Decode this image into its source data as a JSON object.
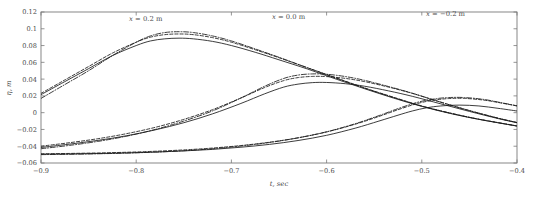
{
  "chart_data": {
    "type": "line",
    "title": "",
    "xlabel": "t, sec",
    "ylabel": "η, m",
    "xlim": [
      -0.9,
      -0.4
    ],
    "ylim": [
      -0.06,
      0.12
    ],
    "grid": false,
    "legend_position": "none",
    "xticks": [
      "-0.9",
      "-0.8",
      "-0.7",
      "-0.6",
      "-0.5",
      "-0.4"
    ],
    "xtick_values": [
      -0.9,
      -0.8,
      -0.7,
      -0.6,
      -0.5,
      -0.4
    ],
    "yticks": [
      "0.12",
      "0.1",
      "0.08",
      "0.06",
      "0.04",
      "0.02",
      "0",
      "-0.02",
      "-0.04",
      "-0.06"
    ],
    "ytick_values": [
      0.12,
      0.1,
      0.08,
      0.06,
      0.04,
      0.02,
      0,
      -0.02,
      -0.04,
      -0.06
    ],
    "annotations": [
      {
        "text": "x = 0.2 m",
        "x": -0.79,
        "y": 0.109
      },
      {
        "text": "x = 0.0 m",
        "x": -0.64,
        "y": 0.112
      },
      {
        "text": "x = −0.2 m",
        "x": -0.475,
        "y": 0.115
      }
    ],
    "groups": [
      {
        "name": "x = 0.2 m",
        "series": [
          {
            "name": "solid",
            "style": "solid",
            "x": [
              -0.9,
              -0.875,
              -0.85,
              -0.825,
              -0.8,
              -0.785,
              -0.77,
              -0.755,
              -0.74,
              -0.72,
              -0.7,
              -0.675,
              -0.65,
              -0.62,
              -0.59,
              -0.56,
              -0.53,
              -0.5,
              -0.47,
              -0.44,
              -0.4
            ],
            "y": [
              0.0215,
              0.037,
              0.0525,
              0.068,
              0.08,
              0.0855,
              0.088,
              0.0888,
              0.088,
              0.085,
              0.08,
              0.072,
              0.063,
              0.052,
              0.04,
              0.0285,
              0.0175,
              0.0075,
              -0.001,
              -0.008,
              -0.016
            ]
          },
          {
            "name": "dashed",
            "style": "dashed",
            "x": [
              -0.9,
              -0.875,
              -0.85,
              -0.825,
              -0.8,
              -0.785,
              -0.77,
              -0.755,
              -0.74,
              -0.72,
              -0.7,
              -0.675,
              -0.65,
              -0.62,
              -0.59,
              -0.56,
              -0.53,
              -0.5,
              -0.47,
              -0.44,
              -0.4
            ],
            "y": [
              0.023,
              0.039,
              0.055,
              0.071,
              0.084,
              0.09,
              0.093,
              0.0938,
              0.093,
              0.0895,
              0.084,
              0.075,
              0.0655,
              0.0535,
              0.0415,
              0.0295,
              0.0185,
              0.008,
              -0.0005,
              -0.0078,
              -0.0158
            ]
          },
          {
            "name": "dashdot",
            "style": "dashdot",
            "x": [
              -0.9,
              -0.875,
              -0.85,
              -0.825,
              -0.8,
              -0.785,
              -0.77,
              -0.755,
              -0.74,
              -0.72,
              -0.7,
              -0.675,
              -0.65,
              -0.62,
              -0.59,
              -0.56,
              -0.53,
              -0.5,
              -0.47,
              -0.44,
              -0.4
            ],
            "y": [
              0.017,
              0.0335,
              0.05,
              0.068,
              0.084,
              0.0915,
              0.0955,
              0.0965,
              0.0955,
              0.0915,
              0.0855,
              0.076,
              0.066,
              0.0535,
              0.0412,
              0.0292,
              0.0182,
              0.0078,
              -0.0006,
              -0.0078,
              -0.0158
            ]
          }
        ]
      },
      {
        "name": "x = 0.0 m",
        "series": [
          {
            "name": "solid",
            "style": "solid",
            "x": [
              -0.9,
              -0.87,
              -0.84,
              -0.81,
              -0.78,
              -0.75,
              -0.72,
              -0.69,
              -0.665,
              -0.645,
              -0.63,
              -0.615,
              -0.6,
              -0.58,
              -0.56,
              -0.535,
              -0.51,
              -0.48,
              -0.45,
              -0.42,
              -0.4
            ],
            "y": [
              -0.0415,
              -0.0375,
              -0.033,
              -0.0275,
              -0.0205,
              -0.012,
              -0.0015,
              0.011,
              0.0225,
              0.0305,
              0.034,
              0.0358,
              0.036,
              0.0345,
              0.0315,
              0.026,
              0.0195,
              0.0105,
              0.0015,
              -0.007,
              -0.012
            ]
          },
          {
            "name": "dashed",
            "style": "dashed",
            "x": [
              -0.9,
              -0.87,
              -0.84,
              -0.81,
              -0.78,
              -0.75,
              -0.72,
              -0.69,
              -0.665,
              -0.645,
              -0.63,
              -0.615,
              -0.6,
              -0.58,
              -0.56,
              -0.535,
              -0.51,
              -0.48,
              -0.45,
              -0.42,
              -0.4
            ],
            "y": [
              -0.04,
              -0.0358,
              -0.031,
              -0.025,
              -0.0175,
              -0.008,
              0.0035,
              0.0175,
              0.03,
              0.0382,
              0.0418,
              0.0432,
              0.043,
              0.0408,
              0.037,
              0.0305,
              0.023,
              0.0125,
              0.0025,
              -0.0065,
              -0.0118
            ]
          },
          {
            "name": "dashdot",
            "style": "dashdot",
            "x": [
              -0.9,
              -0.87,
              -0.84,
              -0.81,
              -0.78,
              -0.75,
              -0.72,
              -0.69,
              -0.665,
              -0.645,
              -0.63,
              -0.615,
              -0.6,
              -0.58,
              -0.56,
              -0.535,
              -0.51,
              -0.48,
              -0.45,
              -0.42,
              -0.4
            ],
            "y": [
              -0.043,
              -0.039,
              -0.0342,
              -0.028,
              -0.02,
              -0.01,
              0.002,
              0.0175,
              0.0315,
              0.0408,
              0.0448,
              0.0462,
              0.0458,
              0.043,
              0.0385,
              0.0312,
              0.0232,
              0.0125,
              0.0025,
              -0.0065,
              -0.0118
            ]
          }
        ]
      },
      {
        "name": "x = -0.2 m",
        "series": [
          {
            "name": "solid",
            "style": "solid",
            "x": [
              -0.9,
              -0.87,
              -0.84,
              -0.81,
              -0.78,
              -0.75,
              -0.72,
              -0.69,
              -0.66,
              -0.63,
              -0.6,
              -0.57,
              -0.545,
              -0.525,
              -0.51,
              -0.495,
              -0.48,
              -0.46,
              -0.44,
              -0.42,
              -0.4
            ],
            "y": [
              -0.0495,
              -0.0492,
              -0.0487,
              -0.048,
              -0.047,
              -0.0456,
              -0.0438,
              -0.0412,
              -0.0378,
              -0.0332,
              -0.027,
              -0.0185,
              -0.01,
              -0.003,
              0.002,
              0.0058,
              0.008,
              0.009,
              0.008,
              0.0052,
              0.002
            ]
          },
          {
            "name": "dashed",
            "style": "dashed",
            "x": [
              -0.9,
              -0.87,
              -0.84,
              -0.81,
              -0.78,
              -0.75,
              -0.72,
              -0.69,
              -0.66,
              -0.63,
              -0.6,
              -0.57,
              -0.545,
              -0.525,
              -0.505,
              -0.488,
              -0.472,
              -0.455,
              -0.435,
              -0.418,
              -0.4
            ],
            "y": [
              -0.049,
              -0.0486,
              -0.048,
              -0.0472,
              -0.046,
              -0.0444,
              -0.0422,
              -0.0392,
              -0.0352,
              -0.03,
              -0.023,
              -0.0138,
              -0.0045,
              0.0035,
              0.0108,
              0.0148,
              0.0168,
              0.017,
              0.015,
              0.0118,
              0.008
            ]
          },
          {
            "name": "dashdot",
            "style": "dashdot",
            "x": [
              -0.9,
              -0.87,
              -0.84,
              -0.81,
              -0.78,
              -0.75,
              -0.72,
              -0.69,
              -0.66,
              -0.63,
              -0.6,
              -0.57,
              -0.545,
              -0.525,
              -0.505,
              -0.488,
              -0.472,
              -0.455,
              -0.435,
              -0.418,
              -0.4
            ],
            "y": [
              -0.05,
              -0.0496,
              -0.049,
              -0.0482,
              -0.047,
              -0.0454,
              -0.043,
              -0.0398,
              -0.0356,
              -0.03,
              -0.0228,
              -0.0132,
              -0.0035,
              0.0048,
              0.0122,
              0.0162,
              0.018,
              0.018,
              0.0158,
              0.0122,
              0.0082
            ]
          }
        ]
      }
    ]
  }
}
